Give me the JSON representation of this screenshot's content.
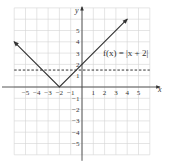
{
  "chart_data": {
    "type": "line",
    "title": "",
    "xlabel": "x",
    "ylabel": "y",
    "xlim": [
      -6,
      6
    ],
    "ylim": [
      -6,
      7
    ],
    "grid": true,
    "x_ticks": [
      "-5",
      "-4",
      "-3",
      "-2",
      "-1",
      "1",
      "2",
      "3",
      "4",
      "5"
    ],
    "y_ticks": [
      "5",
      "4",
      "3",
      "2",
      "1",
      "-1",
      "-2",
      "-3",
      "-4",
      "-5"
    ],
    "series": [
      {
        "name": "f(x) = |x + 2|",
        "style": "solid with arrows",
        "x": [
          -6,
          -2,
          4
        ],
        "y": [
          4,
          0,
          6
        ]
      },
      {
        "name": "horizontal dashed line",
        "style": "dashed",
        "x": [
          -6,
          6
        ],
        "y": [
          1.5,
          1.5
        ]
      }
    ],
    "annotations": [
      {
        "text": "f(x) = |x + 2|",
        "x": 1.5,
        "y": 3
      }
    ]
  },
  "labels": {
    "x_axis": "x",
    "y_axis": "y",
    "function": "f(x) = |x + 2|"
  },
  "ticks": {
    "x": [
      {
        "v": -5,
        "t": "−5"
      },
      {
        "v": -4,
        "t": "−4"
      },
      {
        "v": -3,
        "t": "−3"
      },
      {
        "v": -2,
        "t": "−2"
      },
      {
        "v": -1,
        "t": "−1"
      },
      {
        "v": 1,
        "t": "1"
      },
      {
        "v": 2,
        "t": "2"
      },
      {
        "v": 3,
        "t": "3"
      },
      {
        "v": 4,
        "t": "4"
      },
      {
        "v": 5,
        "t": "5"
      }
    ],
    "y": [
      {
        "v": 5,
        "t": "5"
      },
      {
        "v": 4,
        "t": "4"
      },
      {
        "v": 3,
        "t": "3"
      },
      {
        "v": 2,
        "t": "2"
      },
      {
        "v": 1,
        "t": "1"
      },
      {
        "v": -1,
        "t": "−1"
      },
      {
        "v": -2,
        "t": "−2"
      },
      {
        "v": -3,
        "t": "−3"
      },
      {
        "v": -4,
        "t": "−4"
      },
      {
        "v": -5,
        "t": "−5"
      }
    ]
  },
  "colors": {
    "grid": "#d4d4d4",
    "axis": "#444444",
    "curve": "#333333",
    "dashed": "#333333"
  }
}
